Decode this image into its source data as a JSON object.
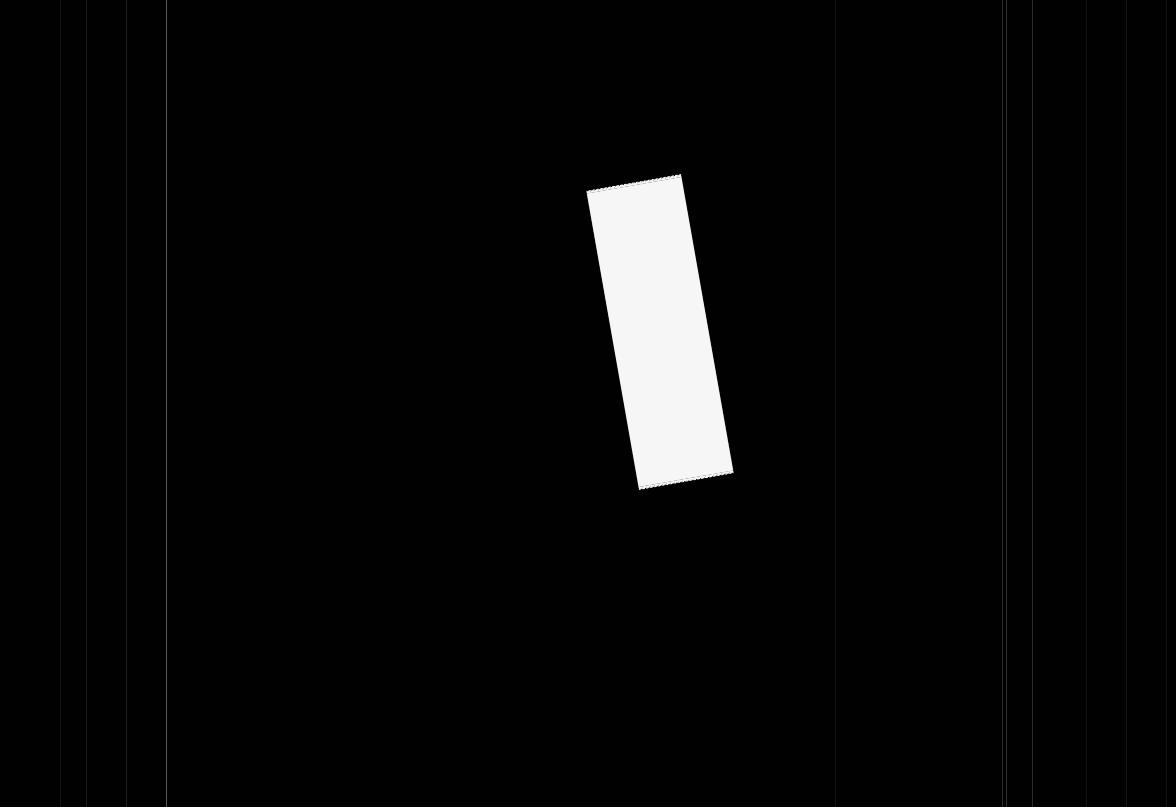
{
  "scene": {
    "description": "Blank torn paper strip on black scanner background",
    "background_color": "#010101",
    "paper": {
      "color": "#f6f6f6",
      "center_x": 660,
      "center_y": 332,
      "width": 96,
      "height": 298,
      "rotation_deg": -10,
      "text": ""
    },
    "scan_lines": [
      {
        "x": 60,
        "color": "#141414"
      },
      {
        "x": 86,
        "color": "#1c1c1c"
      },
      {
        "x": 126,
        "color": "#1e1e1e"
      },
      {
        "x": 166,
        "color": "#5a5a5a"
      },
      {
        "x": 835,
        "color": "#121212"
      },
      {
        "x": 1002,
        "color": "#2a2a2a"
      },
      {
        "x": 1006,
        "color": "#303030"
      },
      {
        "x": 1032,
        "color": "#2c2c2c"
      },
      {
        "x": 1086,
        "color": "#141414"
      },
      {
        "x": 1126,
        "color": "#161616"
      },
      {
        "x": 1166,
        "color": "#141414"
      }
    ]
  }
}
